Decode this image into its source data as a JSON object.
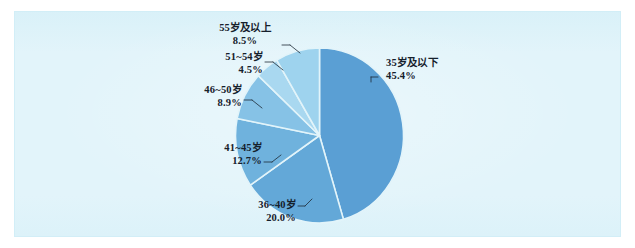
{
  "figure": {
    "panel_background": "#e2f4fa",
    "panel_border": "#d2eef7"
  },
  "chart_data": {
    "type": "pie",
    "title": "",
    "subtitle": "",
    "xlabel": "",
    "ylabel": "",
    "legend_position": "none",
    "grid": false,
    "value_unit": "percent",
    "start_angle_deg": 0,
    "direction": "clockwise",
    "categories": [
      "35岁及以下",
      "36~40岁",
      "41~45岁",
      "46~50岁",
      "51~54岁",
      "55岁及以上"
    ],
    "values": [
      45.4,
      20.0,
      12.7,
      8.9,
      4.5,
      8.5
    ],
    "value_labels": [
      "45.4%",
      "20.0%",
      "12.7%",
      "8.9%",
      "4.5%",
      "8.5%"
    ],
    "colors": [
      "#5a9fd4",
      "#63a8d8",
      "#6fb2dd",
      "#86c2e6",
      "#a9d8f0",
      "#9ed3ee"
    ],
    "slices": [
      {
        "label": "35岁及以下",
        "value": 45.4,
        "value_label": "45.4%",
        "color": "#5a9fd4"
      },
      {
        "label": "36~40岁",
        "value": 20.0,
        "value_label": "20.0%",
        "color": "#63a8d8"
      },
      {
        "label": "41~45岁",
        "value": 12.7,
        "value_label": "12.7%",
        "color": "#6fb2dd"
      },
      {
        "label": "46~50岁",
        "value": 8.9,
        "value_label": "8.9%",
        "color": "#86c2e6"
      },
      {
        "label": "51~54岁",
        "value": 4.5,
        "value_label": "4.5%",
        "color": "#a9d8f0"
      },
      {
        "label": "55岁及以上",
        "value": 8.5,
        "value_label": "8.5%",
        "color": "#9ed3ee"
      }
    ]
  },
  "labels": {
    "s0": {
      "cat": "35岁及以下",
      "pct": "45.4%"
    },
    "s1": {
      "cat": "36~40岁",
      "pct": "20.0%"
    },
    "s2": {
      "cat": "41~45岁",
      "pct": "12.7%"
    },
    "s3": {
      "cat": "46~50岁",
      "pct": "8.9%"
    },
    "s4": {
      "cat": "51~54岁",
      "pct": "4.5%"
    },
    "s5": {
      "cat": "55岁及以上",
      "pct": "8.5%"
    }
  }
}
